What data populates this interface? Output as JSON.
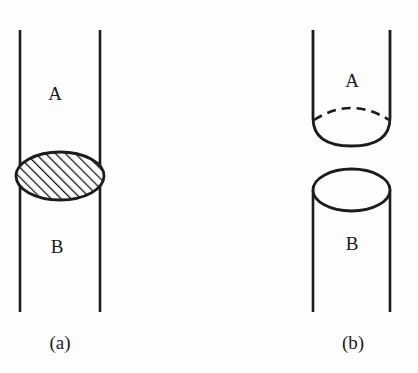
{
  "figure": {
    "background_color": "#fdfdfd",
    "ink_color": "#1c1c1c",
    "width": 418,
    "height": 373
  },
  "panels": [
    {
      "id": "a",
      "caption": "(a)",
      "caption_x": 60,
      "caption_y": 345,
      "description": "Vertical tube with a hatched lens-shaped plug separating region A above from region B below",
      "tube": {
        "left_x": 20,
        "right_x": 100,
        "top_y": 30,
        "bottom_y": 312,
        "stroke_width": 2.6
      },
      "plug": {
        "shape": "ellipse",
        "hatched": true,
        "center_x": 60,
        "center_y": 176,
        "radius_x": 44,
        "radius_y": 24,
        "hatch_angle_deg": 45,
        "hatch_spacing": 7,
        "stroke_width": 2.6
      },
      "labels": [
        {
          "text": "A",
          "x": 55,
          "y": 96
        },
        {
          "text": "B",
          "x": 57,
          "y": 249
        }
      ]
    },
    {
      "id": "b",
      "caption": "(b)",
      "caption_x": 353,
      "caption_y": 345,
      "description": "Separated tube halves: upper tube A with rounded closed bottom and dashed hidden rim, lower tube B with open elliptical top",
      "upper_tube": {
        "left_x": 313,
        "right_x": 390,
        "top_y": 30,
        "side_bottom_y": 120,
        "bowl_bottom_y": 143,
        "dashed_rim_apex_y": 107,
        "stroke_width": 2.6,
        "dash_pattern": "9 6"
      },
      "lower_tube": {
        "left_x": 313,
        "right_x": 390,
        "rim_center_y": 190,
        "rim_radius_y": 21,
        "bottom_y": 312,
        "stroke_width": 2.6
      },
      "labels": [
        {
          "text": "A",
          "x": 352,
          "y": 83
        },
        {
          "text": "B",
          "x": 352,
          "y": 246
        }
      ]
    }
  ]
}
